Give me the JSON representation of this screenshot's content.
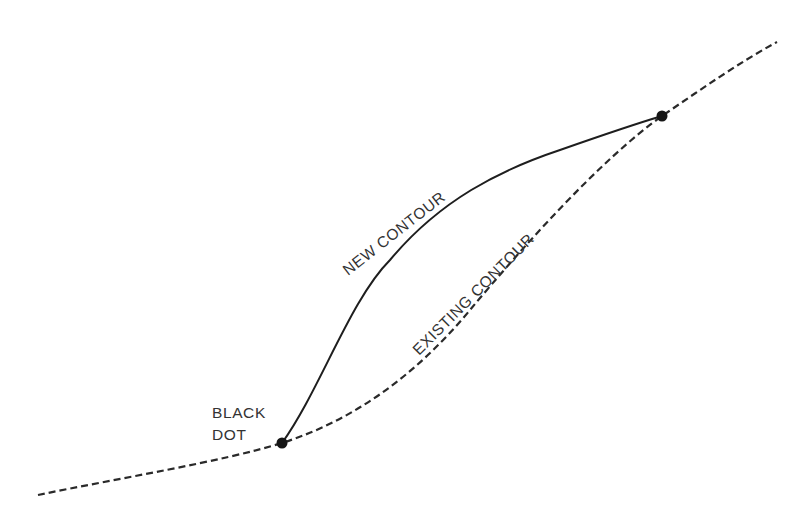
{
  "diagram": {
    "type": "contour-grading-diagram",
    "colors": {
      "background": "#ffffff",
      "line": "#222222",
      "text": "#333333",
      "dot": "#151515"
    },
    "labels": {
      "new_contour": "NEW CONTOUR",
      "existing_contour": "EXISTING CONTOUR",
      "black_dot_line1": "BLACK",
      "black_dot_line2": "DOT"
    },
    "existing_contour": {
      "style": "dashed",
      "path": "M 38 495 C 120 478, 220 462, 282 443 C 360 418, 420 370, 470 310 C 520 250, 600 160, 662 116 C 700 90, 740 62, 777 42"
    },
    "new_contour": {
      "style": "solid",
      "path": "M 282 443 C 320 390, 350 300, 390 260 C 440 200, 500 170, 560 150 C 600 136, 635 124, 662 116"
    },
    "black_dots": [
      {
        "name": "lower-black-dot",
        "cx": 282,
        "cy": 443,
        "r": 5.5
      },
      {
        "name": "upper-black-dot",
        "cx": 662,
        "cy": 116,
        "r": 5.5
      }
    ]
  }
}
